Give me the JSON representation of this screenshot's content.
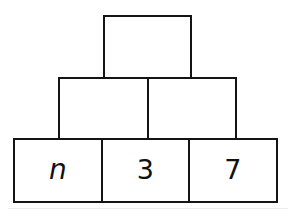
{
  "figure": {
    "name": "block-pyramid",
    "background_color": "#ffffff",
    "stroke_color": "#141414",
    "text_color": "#111111",
    "rows": [
      {
        "tier": "top",
        "cells": [
          {
            "id": "top-1",
            "label": ""
          }
        ]
      },
      {
        "tier": "middle",
        "cells": [
          {
            "id": "mid-1",
            "label": ""
          },
          {
            "id": "mid-2",
            "label": ""
          }
        ]
      },
      {
        "tier": "bottom",
        "cells": [
          {
            "id": "bottom-1",
            "label": "n"
          },
          {
            "id": "bottom-2",
            "label": "3"
          },
          {
            "id": "bottom-3",
            "label": "7"
          }
        ]
      }
    ]
  }
}
